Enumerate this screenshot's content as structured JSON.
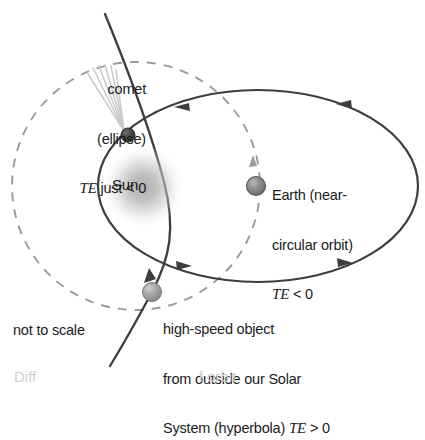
{
  "figure": {
    "note": "not to scale",
    "cut_caption": "Diff                                       f orbit"
  },
  "bodies": {
    "sun": {
      "name": "Sun",
      "label": "Sun",
      "color": "#b9b9b9",
      "cx": 143,
      "cy": 187,
      "glow_radius": 42
    },
    "comet": {
      "name": "comet",
      "color": "#4f4f4f",
      "cx": 128,
      "cy": 135,
      "radius": 7
    },
    "earth": {
      "name": "Earth",
      "color": "#8a8a8a",
      "cx": 256,
      "cy": 186,
      "radius": 9
    },
    "interstellar_object": {
      "name": "high-speed object",
      "color": "#a8a8a8",
      "cx": 152,
      "cy": 292,
      "radius": 9
    }
  },
  "labels": {
    "comet": {
      "line1": "comet",
      "line2": "(ellipse)",
      "energy_symbol": "TE",
      "energy_text": " just < 0"
    },
    "earth": {
      "line1": "Earth (near-",
      "line2": "circular orbit)",
      "energy_symbol": "TE",
      "energy_text": " < 0"
    },
    "hyperbola": {
      "line1": "high-speed object",
      "line2": "from outside our Solar",
      "line3_prefix": "System (hyperbola) ",
      "energy_symbol": "TE",
      "energy_text": " > 0"
    }
  },
  "orbits": {
    "comet_ellipse": {
      "kind": "ellipse",
      "stroke": "#3d3d3d",
      "dashed": false,
      "direction": "counterclockwise",
      "cx": 258,
      "cy": 186,
      "rx": 160,
      "ry": 96
    },
    "earth_circle": {
      "kind": "circle",
      "stroke": "#9a9a9a",
      "dashed": true,
      "cx": 136,
      "cy": 186,
      "r": 124
    },
    "hyperbola_path": {
      "kind": "hyperbola",
      "stroke": "#3d3d3d",
      "dashed": false,
      "direction": "upward"
    }
  },
  "colors": {
    "background": "#ffffff",
    "solid_orbit": "#3d3d3d",
    "dashed_orbit": "#9a9a9a",
    "text": "#1b1b1b",
    "comet_tail": "#c9c9c9"
  }
}
